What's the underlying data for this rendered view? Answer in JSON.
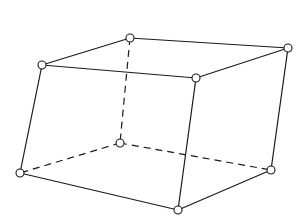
{
  "diagram": {
    "type": "wireframe-hexahedron",
    "colors": {
      "stroke": "#1a1a1a",
      "node_fill": "#ffffff",
      "background": "#ffffff"
    },
    "node_radius": 4,
    "nodes": [
      {
        "id": "top-back",
        "x": 130,
        "y": 38
      },
      {
        "id": "top-left",
        "x": 42,
        "y": 65
      },
      {
        "id": "top-front",
        "x": 196,
        "y": 78
      },
      {
        "id": "top-right",
        "x": 288,
        "y": 48
      },
      {
        "id": "bottom-back",
        "x": 120,
        "y": 143
      },
      {
        "id": "bottom-left",
        "x": 20,
        "y": 173
      },
      {
        "id": "bottom-front",
        "x": 178,
        "y": 210
      },
      {
        "id": "bottom-right",
        "x": 271,
        "y": 170
      }
    ],
    "edges": [
      {
        "from": "top-left",
        "to": "top-back",
        "style": "solid"
      },
      {
        "from": "top-back",
        "to": "top-right",
        "style": "solid"
      },
      {
        "from": "top-left",
        "to": "top-front",
        "style": "solid"
      },
      {
        "from": "top-front",
        "to": "top-right",
        "style": "solid"
      },
      {
        "from": "top-left",
        "to": "bottom-left",
        "style": "solid"
      },
      {
        "from": "top-front",
        "to": "bottom-front",
        "style": "solid"
      },
      {
        "from": "top-right",
        "to": "bottom-right",
        "style": "solid"
      },
      {
        "from": "bottom-left",
        "to": "bottom-front",
        "style": "solid"
      },
      {
        "from": "bottom-front",
        "to": "bottom-right",
        "style": "solid"
      },
      {
        "from": "top-back",
        "to": "bottom-back",
        "style": "dashed"
      },
      {
        "from": "bottom-back",
        "to": "bottom-left",
        "style": "dashed"
      },
      {
        "from": "bottom-back",
        "to": "bottom-right",
        "style": "dashed"
      }
    ]
  }
}
